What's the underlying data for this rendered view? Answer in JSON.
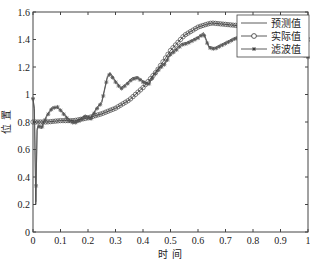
{
  "chart_data": {
    "type": "line",
    "title": "",
    "xlabel": "时 间",
    "ylabel": "位 置",
    "xlim": [
      0,
      1
    ],
    "ylim": [
      0,
      1.6
    ],
    "xticks": [
      "0",
      "0.1",
      "0.2",
      "0.3",
      "0.4",
      "0.5",
      "0.6",
      "0.7",
      "0.8",
      "0.9",
      "1"
    ],
    "yticks": [
      "0",
      "0.2",
      "0.4",
      "0.6",
      "0.8",
      "1",
      "1.2",
      "1.4",
      "1.6"
    ],
    "grid": false,
    "legend_position": "upper right",
    "series": [
      {
        "name": "预测值",
        "marker": "none",
        "color": "#333333",
        "x": [
          0,
          0.005,
          0.01,
          0.015,
          0.02,
          0.03,
          0.05,
          0.07,
          0.09,
          0.11,
          0.13,
          0.15,
          0.17,
          0.19,
          0.21,
          0.23,
          0.25,
          0.27,
          0.28,
          0.3,
          0.32,
          0.34,
          0.36,
          0.38,
          0.4,
          0.42,
          0.44,
          0.46,
          0.48,
          0.5,
          0.52,
          0.54,
          0.56,
          0.58,
          0.6,
          0.62,
          0.64,
          0.66,
          0.68,
          0.7,
          0.72,
          0.74,
          0.76,
          0.78,
          0.8,
          0.85,
          0.9,
          0.95,
          0.98,
          1.0
        ],
        "y": [
          0.97,
          0.9,
          0.2,
          0.75,
          0.78,
          0.76,
          0.85,
          0.91,
          0.9,
          0.87,
          0.82,
          0.8,
          0.82,
          0.85,
          0.83,
          0.9,
          0.95,
          1.13,
          1.16,
          1.1,
          1.05,
          1.08,
          1.12,
          1.13,
          1.1,
          1.08,
          1.15,
          1.2,
          1.23,
          1.3,
          1.33,
          1.37,
          1.38,
          1.4,
          1.42,
          1.45,
          1.35,
          1.34,
          1.36,
          1.38,
          1.4,
          1.42,
          1.41,
          1.39,
          1.4,
          1.42,
          1.45,
          1.43,
          1.3,
          1.28
        ]
      },
      {
        "name": "实际值",
        "marker": "circle",
        "color": "#333333",
        "x": [
          0,
          0.05,
          0.1,
          0.15,
          0.2,
          0.25,
          0.3,
          0.35,
          0.4,
          0.45,
          0.5,
          0.55,
          0.6,
          0.63,
          0.65,
          0.7,
          0.75,
          0.8,
          0.85,
          0.9,
          0.95,
          1.0
        ],
        "y": [
          0.8,
          0.8,
          0.81,
          0.81,
          0.83,
          0.86,
          0.9,
          0.96,
          1.05,
          1.17,
          1.32,
          1.43,
          1.49,
          1.51,
          1.52,
          1.51,
          1.5,
          1.5,
          1.48,
          1.45,
          1.42,
          1.4
        ]
      },
      {
        "name": "滤波值",
        "marker": "star",
        "color": "#555555",
        "x": [
          0,
          0.005,
          0.01,
          0.015,
          0.02,
          0.03,
          0.05,
          0.07,
          0.09,
          0.11,
          0.13,
          0.15,
          0.17,
          0.19,
          0.21,
          0.23,
          0.25,
          0.27,
          0.28,
          0.3,
          0.32,
          0.34,
          0.36,
          0.38,
          0.4,
          0.42,
          0.44,
          0.46,
          0.48,
          0.5,
          0.52,
          0.54,
          0.56,
          0.58,
          0.6,
          0.62,
          0.64,
          0.66,
          0.68,
          0.7,
          0.72,
          0.74,
          0.76,
          0.78,
          0.8,
          0.85,
          0.9,
          0.95,
          0.98,
          1.0
        ],
        "y": [
          0.97,
          0.88,
          0.22,
          0.74,
          0.77,
          0.75,
          0.84,
          0.9,
          0.91,
          0.86,
          0.81,
          0.79,
          0.81,
          0.84,
          0.82,
          0.89,
          0.94,
          1.12,
          1.15,
          1.09,
          1.04,
          1.07,
          1.11,
          1.12,
          1.09,
          1.07,
          1.14,
          1.19,
          1.22,
          1.29,
          1.32,
          1.36,
          1.37,
          1.39,
          1.41,
          1.44,
          1.34,
          1.33,
          1.35,
          1.37,
          1.39,
          1.41,
          1.4,
          1.38,
          1.39,
          1.41,
          1.44,
          1.42,
          1.29,
          1.27
        ]
      }
    ]
  },
  "plot_area": {
    "left": 33,
    "right": 308,
    "top": 12,
    "bottom": 232
  },
  "legend": {
    "items": [
      {
        "label": "预测值",
        "marker": "line"
      },
      {
        "label": "实际值",
        "marker": "circle"
      },
      {
        "label": "滤波值",
        "marker": "star"
      }
    ]
  }
}
